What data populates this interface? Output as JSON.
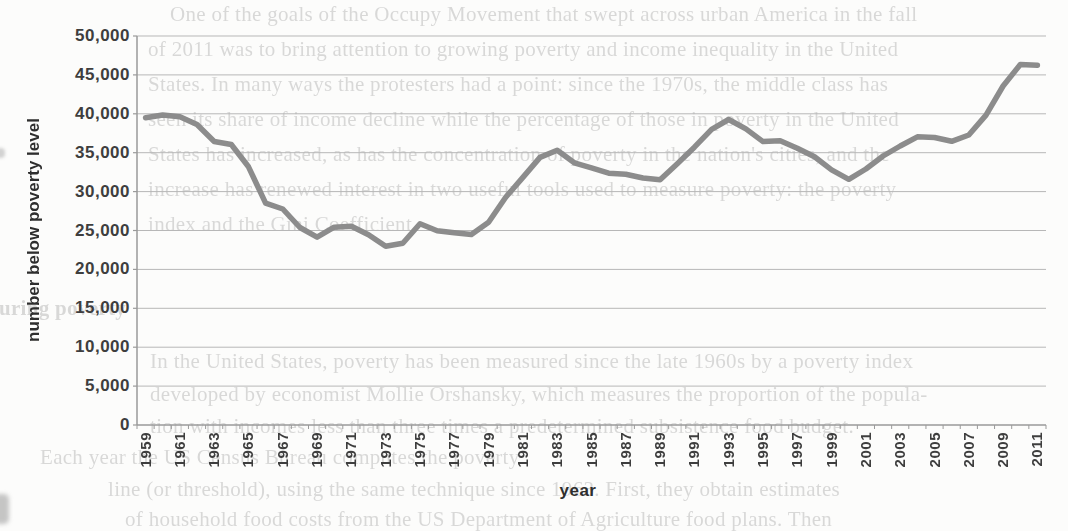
{
  "page": {
    "background_text": {
      "top_lines": [
        "One of the goals of the Occupy Movement that swept across urban America in the fall",
        "of 2011 was to bring attention to growing poverty and income inequality in the United",
        "States. In many ways the protesters had a point: since the 1970s, the middle class has",
        "seen its share of income decline while the percentage of those in poverty in the United",
        "States has increased, as has the concentration of poverty in the nation's cities, and the",
        "increase has renewed interest in two useful tools used to measure poverty: the poverty",
        "index and the Gini Coefficient."
      ],
      "section_heading": "Measuring poverty",
      "bottom_lines": [
        "In the United States, poverty has been measured since the late 1960s by a poverty index",
        "developed by economist Mollie Orshansky, which measures the proportion of the popula-",
        "tion with incomes less than three times a predetermined subsistence food budget.",
        "Each year the US Census Bureau computes the poverty",
        "line (or threshold), using the same technique since 1963. First, they obtain estimates",
        "of household food costs from the US Department of Agriculture food plans. Then"
      ]
    }
  },
  "chart_data": {
    "type": "line",
    "title": "",
    "xlabel": "year",
    "ylabel": "number below poverty level",
    "ylim": [
      0,
      50000
    ],
    "ytick_step": 5000,
    "grid": "horizontal gridlines on",
    "legend": "none",
    "x": [
      1959,
      1960,
      1961,
      1962,
      1963,
      1964,
      1965,
      1966,
      1967,
      1968,
      1969,
      1970,
      1971,
      1972,
      1973,
      1974,
      1975,
      1976,
      1977,
      1978,
      1979,
      1980,
      1981,
      1982,
      1983,
      1984,
      1985,
      1986,
      1987,
      1988,
      1989,
      1990,
      1991,
      1992,
      1993,
      1994,
      1995,
      1996,
      1997,
      1998,
      1999,
      2000,
      2001,
      2002,
      2003,
      2004,
      2005,
      2006,
      2007,
      2008,
      2009,
      2010,
      2011
    ],
    "series": [
      {
        "name": "number below poverty level (thousands)",
        "values": [
          39490,
          39851,
          39628,
          38625,
          36436,
          36055,
          33185,
          28510,
          27769,
          25389,
          24147,
          25420,
          25559,
          24460,
          22973,
          23370,
          25877,
          24975,
          24720,
          24497,
          26072,
          29272,
          31822,
          34398,
          35303,
          33700,
          33064,
          32370,
          32221,
          31745,
          31528,
          33585,
          35708,
          38014,
          39265,
          38059,
          36425,
          36529,
          35574,
          34476,
          32791,
          31581,
          32907,
          34570,
          35861,
          37040,
          36950,
          36460,
          37276,
          39829,
          43569,
          46343,
          46247
        ]
      }
    ],
    "xtick_labels": [
      "1959",
      "1961",
      "1963",
      "1965",
      "1967",
      "1969",
      "1971",
      "1973",
      "1975",
      "1977",
      "1979",
      "1981",
      "1983",
      "1985",
      "1987",
      "1989",
      "1991",
      "1993",
      "1995",
      "1997",
      "1999",
      "2001",
      "2003",
      "2005",
      "2007",
      "2009",
      "2011"
    ],
    "ytick_labels": [
      "0",
      "5,000",
      "10,000",
      "15,000",
      "20,000",
      "25,000",
      "30,000",
      "35,000",
      "40,000",
      "45,000",
      "50,000"
    ],
    "colors": {
      "series_line": "#8c8c8c",
      "gridline": "#b7b7b7",
      "axis": "#9a9a9a",
      "tick_label": "#3e3e3e"
    }
  }
}
